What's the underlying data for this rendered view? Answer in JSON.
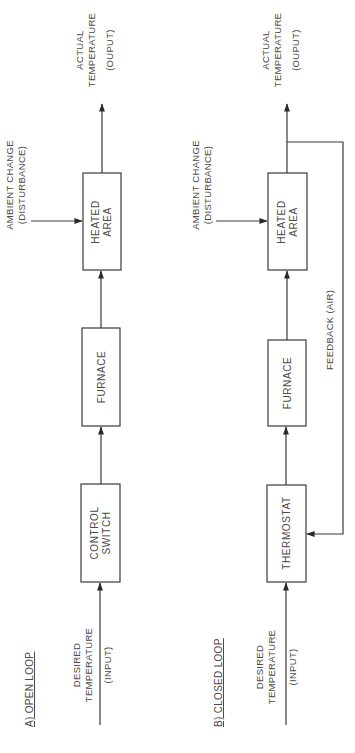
{
  "orientation": "rotated -90 degrees (reads bottom-to-top)",
  "open_loop": {
    "title": "A) OPEN LOOP",
    "input_label": [
      "DESIRED",
      "TEMPERATURE",
      "(INPUT)"
    ],
    "blocks": [
      {
        "id": "control-switch",
        "lines": [
          "CONTROL",
          "SWITCH"
        ]
      },
      {
        "id": "furnace",
        "lines": [
          "FURNACE"
        ]
      },
      {
        "id": "heated-area",
        "lines": [
          "HEATED",
          "AREA"
        ]
      }
    ],
    "disturbance_label": [
      "AMBIENT  CHANGE",
      "(DISTURBANCE)"
    ],
    "output_label": [
      "ACTUAL",
      "TEMPERATURE",
      "(OUPUT)"
    ]
  },
  "closed_loop": {
    "title": "B) CLOSED LOOP",
    "input_label": [
      "DESIRED",
      "TEMPERATURE",
      "(INPUT)"
    ],
    "blocks": [
      {
        "id": "thermostat",
        "lines": [
          "THERMOSTAT"
        ]
      },
      {
        "id": "furnace",
        "lines": [
          "FURNACE"
        ]
      },
      {
        "id": "heated-area",
        "lines": [
          "HEATED",
          "AREA"
        ]
      }
    ],
    "disturbance_label": [
      "AMBIENT  CHANGE",
      "(DISTURBANCE)"
    ],
    "output_label": [
      "ACTUAL",
      "TEMPERATURE",
      "(OUPUT)"
    ],
    "feedback_label": "FEEDBACK (AIR)"
  },
  "colors": {
    "line": "#3a3a3a",
    "text": "#4a4a4a",
    "background": "#ffffff"
  }
}
